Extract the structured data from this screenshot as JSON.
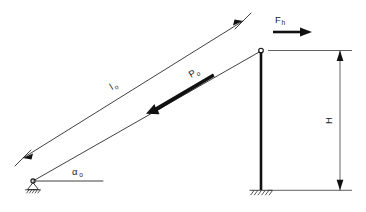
{
  "figure": {
    "background_color": "#ffffff",
    "line_color": "#2b2b2b",
    "heavy_line_color": "#111111"
  },
  "labels": {
    "length_symbol": "l",
    "length_subscript": "o",
    "force_axial_symbol": "P",
    "force_axial_subscript": "o",
    "force_horizontal_symbol": "F",
    "force_horizontal_subscript": "h",
    "angle_symbol": "α",
    "angle_subscript": "o",
    "height_symbol": "H"
  },
  "elements": {
    "inclined_bar": "inclined-bar",
    "vertical_column": "vertical-column",
    "pin_support": "pin-support",
    "fixed_support": "fixed-support",
    "top_joint": "top-joint",
    "dimension_line_length": "dimension-line-l0",
    "dimension_line_height": "dimension-line-h",
    "horizontal_reference": "horizontal-reference-line",
    "force_arrow_axial": "axial-force-arrow",
    "force_arrow_horizontal": "horizontal-force-arrow"
  }
}
